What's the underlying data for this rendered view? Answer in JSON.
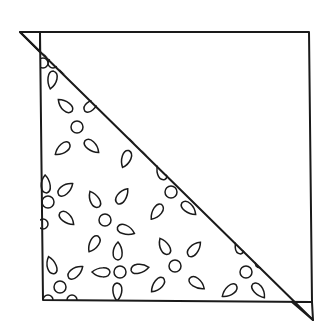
{
  "diagram": {
    "title": "",
    "colors": {
      "line": "#1a1a1a",
      "background": "#ffffff"
    },
    "square": {
      "top_left": [
        40,
        32
      ],
      "top_right": [
        309,
        32
      ],
      "bottom_right": [
        312,
        302
      ],
      "bottom_left": [
        43,
        300
      ]
    },
    "diagonal": {
      "from": [
        20,
        32
      ],
      "to": [
        313,
        320
      ]
    },
    "dog_ears": [
      {
        "position": "top-left",
        "points": [
          [
            20,
            32
          ],
          [
            40,
            32
          ],
          [
            40,
            52
          ]
        ]
      },
      {
        "position": "bottom-right",
        "points": [
          [
            292,
            302
          ],
          [
            312,
            302
          ],
          [
            313,
            320
          ]
        ]
      }
    ],
    "flowers": [
      {
        "c": [
          77,
          127
        ],
        "r": 6,
        "petals": [
          [
            66,
            106,
            -140
          ],
          [
            91,
            106,
            -40
          ],
          [
            63,
            148,
            140
          ],
          [
            91,
            146,
            40
          ]
        ]
      },
      {
        "c": [
          53,
          63
        ],
        "r": 5,
        "petals": [
          [
            48,
            49,
            -110
          ],
          [
            52,
            79,
            100
          ],
          [
            68,
            70,
            20
          ]
        ]
      },
      {
        "c": [
          136,
          136
        ],
        "r": 6,
        "petals": [
          [
            127,
            121,
            -120
          ],
          [
            126,
            158,
            110
          ],
          [
            150,
            151,
            30
          ]
        ]
      },
      {
        "c": [
          48,
          202
        ],
        "r": 6,
        "petals": [
          [
            65,
            190,
            -40
          ],
          [
            66,
            218,
            40
          ],
          [
            46,
            185,
            -95
          ]
        ]
      },
      {
        "c": [
          105,
          220
        ],
        "r": 6,
        "petals": [
          [
            95,
            200,
            -120
          ],
          [
            122,
            197,
            -55
          ],
          [
            94,
            243,
            120
          ],
          [
            125,
            230,
            20
          ]
        ]
      },
      {
        "c": [
          171,
          192
        ],
        "r": 6,
        "petals": [
          [
            162,
            172,
            -110
          ],
          [
            157,
            211,
            125
          ],
          [
            188,
            208,
            40
          ]
        ]
      },
      {
        "c": [
          120,
          272
        ],
        "r": 6,
        "petals": [
          [
            118,
            252,
            -90
          ],
          [
            102,
            272,
            180
          ],
          [
            139,
            269,
            -10
          ],
          [
            117,
            291,
            90
          ]
        ]
      },
      {
        "c": [
          60,
          287
        ],
        "r": 6,
        "petals": [
          [
            52,
            266,
            -110
          ],
          [
            75,
            273,
            -40
          ]
        ]
      },
      {
        "c": [
          175,
          266
        ],
        "r": 6,
        "petals": [
          [
            165,
            247,
            -120
          ],
          [
            194,
            250,
            -50
          ],
          [
            158,
            284,
            130
          ],
          [
            196,
            283,
            35
          ]
        ]
      },
      {
        "c": [
          246,
          272
        ],
        "r": 6,
        "petals": [
          [
            240,
            246,
            -95
          ],
          [
            263,
            262,
            -30
          ],
          [
            230,
            290,
            140
          ],
          [
            258,
            290,
            50
          ]
        ]
      },
      {
        "c": [
          243,
          180
        ],
        "r": 0,
        "petals": []
      }
    ],
    "edge_motifs": [
      {
        "type": "half-circle",
        "c": [
          48,
          300
        ],
        "r": 5
      },
      {
        "type": "half-circle",
        "c": [
          72,
          300
        ],
        "r": 5
      },
      {
        "type": "half-circle",
        "c": [
          43,
          63
        ],
        "r": 5
      },
      {
        "type": "half-circle",
        "c": [
          43,
          224
        ],
        "r": 5
      }
    ]
  }
}
